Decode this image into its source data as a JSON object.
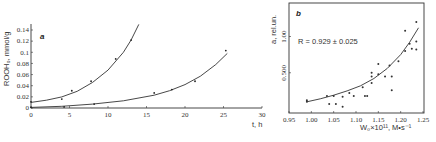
{
  "chart_data": [
    {
      "type": "scatter",
      "panel": "a",
      "title": "",
      "xlabel": "t, h",
      "ylabel": "ROOH₀, mmol/g",
      "xlim": [
        0,
        30
      ],
      "ylim": [
        0,
        0.14
      ],
      "x_ticks": [
        "0",
        "5",
        "10",
        "15",
        "20",
        "25",
        "30"
      ],
      "y_ticks": [
        "0",
        "0.02",
        "0.04",
        "0.06",
        "0.08",
        "0.1",
        "0.12",
        "0.14"
      ],
      "grid": false,
      "series": [
        {
          "name": "upper curve",
          "points": [
            [
              0,
              0.011
            ],
            [
              4,
              0.016
            ],
            [
              5.3,
              0.031
            ],
            [
              7.8,
              0.048
            ],
            [
              11,
              0.088
            ],
            [
              13,
              0.122
            ]
          ],
          "fit": "exponential",
          "fit_points": [
            [
              0,
              0.01
            ],
            [
              2,
              0.014
            ],
            [
              4,
              0.02
            ],
            [
              6,
              0.03
            ],
            [
              8,
              0.046
            ],
            [
              10,
              0.068
            ],
            [
              12,
              0.1
            ],
            [
              13,
              0.122
            ],
            [
              14,
              0.15
            ]
          ]
        },
        {
          "name": "lower curve",
          "points": [
            [
              0,
              0.001
            ],
            [
              4.3,
              0.002
            ],
            [
              8.2,
              0.007
            ],
            [
              16,
              0.027
            ],
            [
              18.3,
              0.033
            ],
            [
              21.3,
              0.048
            ],
            [
              25.3,
              0.103
            ]
          ],
          "fit": "exponential",
          "fit_points": [
            [
              0,
              0.001
            ],
            [
              4,
              0.003
            ],
            [
              8,
              0.007
            ],
            [
              12,
              0.013
            ],
            [
              16,
              0.023
            ],
            [
              18,
              0.031
            ],
            [
              20,
              0.042
            ],
            [
              22,
              0.057
            ],
            [
              24,
              0.078
            ],
            [
              25.5,
              0.098
            ]
          ]
        }
      ]
    },
    {
      "type": "scatter",
      "panel": "b",
      "title": "",
      "xlabel": "W₀×10¹¹, M•s⁻¹",
      "ylabel": "a, rel.un.",
      "xlim": [
        0.95,
        1.25
      ],
      "ylim": [
        0,
        1.3
      ],
      "x_ticks": [
        "0.95",
        "1.00",
        "1.05",
        "1.10",
        "1.15",
        "1.20",
        "1.25"
      ],
      "y_ticks": [
        "0.500",
        "1.00"
      ],
      "grid": false,
      "annotation": "R = 0.929 ± 0.025",
      "series": [
        {
          "name": "data",
          "points": [
            [
              0.99,
              0.12
            ],
            [
              0.99,
              0.1
            ],
            [
              1.035,
              0.18
            ],
            [
              1.04,
              0.07
            ],
            [
              1.05,
              0.18
            ],
            [
              1.055,
              0.07
            ],
            [
              1.07,
              0.17
            ],
            [
              1.07,
              0.03
            ],
            [
              1.085,
              0.22
            ],
            [
              1.095,
              0.18
            ],
            [
              1.115,
              0.3
            ],
            [
              1.12,
              0.18
            ],
            [
              1.125,
              0.18
            ],
            [
              1.135,
              0.5
            ],
            [
              1.135,
              0.45
            ],
            [
              1.135,
              0.36
            ],
            [
              1.15,
              0.62
            ],
            [
              1.15,
              0.48
            ],
            [
              1.165,
              0.45
            ],
            [
              1.175,
              0.6
            ],
            [
              1.18,
              0.45
            ],
            [
              1.18,
              0.26
            ],
            [
              1.195,
              0.66
            ],
            [
              1.21,
              1.08
            ],
            [
              1.21,
              0.8
            ],
            [
              1.22,
              0.9
            ],
            [
              1.225,
              0.83
            ],
            [
              1.235,
              1.2
            ],
            [
              1.235,
              0.93
            ],
            [
              1.235,
              0.82
            ]
          ],
          "fit": "exponential",
          "fit_points": [
            [
              0.99,
              0.1
            ],
            [
              1.02,
              0.14
            ],
            [
              1.05,
              0.19
            ],
            [
              1.08,
              0.25
            ],
            [
              1.11,
              0.32
            ],
            [
              1.14,
              0.42
            ],
            [
              1.17,
              0.56
            ],
            [
              1.2,
              0.75
            ],
            [
              1.22,
              0.92
            ],
            [
              1.24,
              1.12
            ]
          ]
        }
      ]
    }
  ]
}
